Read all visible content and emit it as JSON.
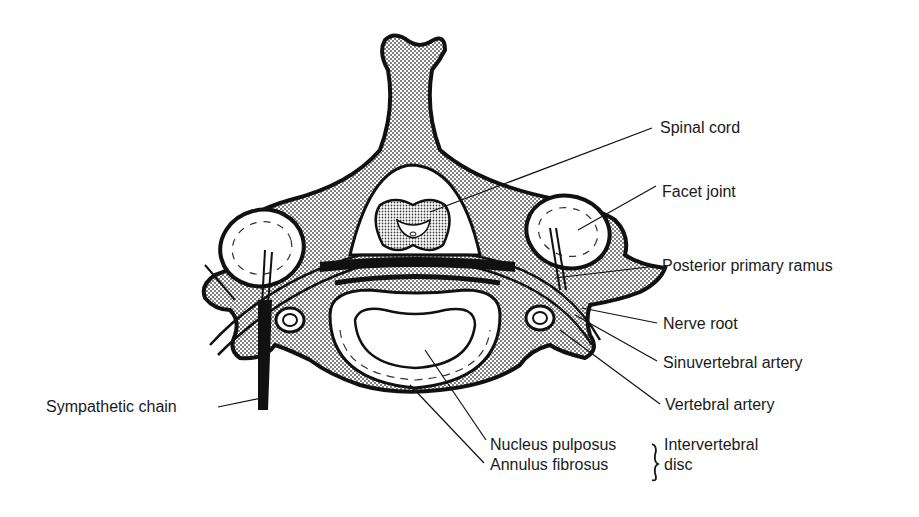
{
  "diagram": {
    "colors": {
      "ink": "#111111",
      "bone_fill": "#b8b8b8",
      "background": "#ffffff"
    },
    "labels": {
      "spinal_cord": "Spinal cord",
      "facet_joint": "Facet joint",
      "posterior_primary_ramus": "Posterior primary ramus",
      "nerve_root": "Nerve root",
      "sinuvertebral_artery": "Sinuvertebral artery",
      "vertebral_artery": "Vertebral artery",
      "sympathetic_chain": "Sympathetic chain",
      "nucleus_pulposus": "Nucleus pulposus",
      "annulus_fibrosus": "Annulus fibrosus",
      "intervertebral_disc_line1": "Intervertebral",
      "intervertebral_disc_line2": "disc"
    }
  }
}
